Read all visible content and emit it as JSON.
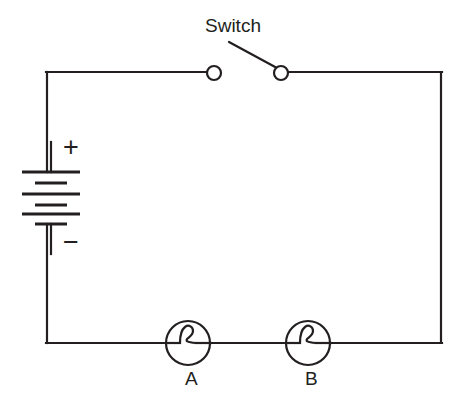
{
  "diagram": {
    "type": "series-circuit-schematic",
    "background_color": "#ffffff",
    "line_color": "#231f20",
    "labels": {
      "switch": "Switch",
      "battery_positive": "+",
      "battery_negative": "−",
      "lamp_a": "A",
      "lamp_b": "B"
    },
    "components": {
      "battery": {
        "name": "battery",
        "cell_count": 3,
        "plate_count": 6,
        "polarity_top": "+",
        "polarity_bottom": "−"
      },
      "switch": {
        "name": "switch",
        "state": "open",
        "contact_count": 2
      },
      "lamp_a": {
        "name": "lamp-a",
        "label": "A",
        "symbol": "circle-with-filament"
      },
      "lamp_b": {
        "name": "lamp-b",
        "label": "B",
        "symbol": "circle-with-filament"
      }
    },
    "geometry": {
      "loop": {
        "left": 47,
        "top": 72,
        "right": 441,
        "bottom": 343
      },
      "switch_contacts": [
        {
          "x": 214,
          "y": 73
        },
        {
          "x": 281,
          "y": 73
        }
      ],
      "switch_lever_tip": {
        "x": 229,
        "y": 42
      },
      "lamp_a_center": {
        "x": 188,
        "y": 343
      },
      "lamp_b_center": {
        "x": 308,
        "y": 343
      },
      "lamp_radius": 22,
      "battery_axis_x": 51,
      "battery_plates": [
        {
          "y": 172,
          "kind": "long"
        },
        {
          "y": 183,
          "kind": "short"
        },
        {
          "y": 194,
          "kind": "long"
        },
        {
          "y": 205,
          "kind": "short"
        },
        {
          "y": 214,
          "kind": "long"
        },
        {
          "y": 224,
          "kind": "short"
        }
      ],
      "plate_long_half_width": 29,
      "plate_short_half_width": 16
    }
  }
}
